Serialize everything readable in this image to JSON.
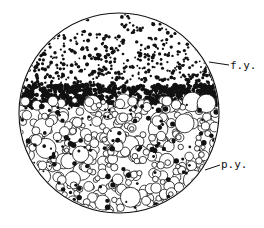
{
  "figure": {
    "type": "scientific-illustration",
    "outline_color": "#111111",
    "background": "#ffffff",
    "circle": {
      "cx": 119,
      "cy": 113,
      "r": 100
    },
    "labels": [
      {
        "id": "fy",
        "text": "f.y.",
        "pointer_from": [
          210,
          64
        ],
        "pointer_to": [
          228,
          66
        ]
      },
      {
        "id": "py",
        "text": "p.y.",
        "pointer_from": [
          207,
          168
        ],
        "pointer_to": [
          219,
          165
        ]
      }
    ],
    "zones": {
      "upper": "dense small black granules",
      "band": "dark packed granules",
      "lower": "open circles of varied size"
    }
  }
}
